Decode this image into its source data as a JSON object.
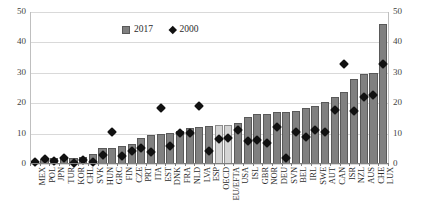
{
  "chart_data": {
    "type": "bar",
    "title": "",
    "subtitle": "",
    "xlabel": "",
    "ylabel": "",
    "ylim": [
      0,
      50
    ],
    "yticks": [
      0,
      10,
      20,
      30,
      40,
      50
    ],
    "grid": true,
    "dual_axis": true,
    "right_yticks": [
      0,
      10,
      20,
      30,
      40,
      50
    ],
    "legend_position": "top-center",
    "legend": [
      {
        "name": "2017",
        "marker": "square",
        "color": "#808080"
      },
      {
        "name": "2000",
        "marker": "diamond",
        "color": "#111111"
      }
    ],
    "categories": [
      "MEX",
      "POL",
      "JPN",
      "TUR",
      "KOR",
      "CHL",
      "SVK",
      "HUN",
      "GRC",
      "FIN",
      "CZE",
      "PRT",
      "ITA",
      "EST",
      "DNK",
      "FRA",
      "NLD",
      "LVA",
      "ESP",
      "OECD",
      "EU/EFTA",
      "USA",
      "ISL",
      "GBR",
      "NOR",
      "DEU",
      "SVN",
      "BEL",
      "IRL",
      "SWE",
      "AUT",
      "CAN",
      "ISR",
      "NZL",
      "AUS",
      "CHE",
      "LUX"
    ],
    "highlight_categories": [
      "OECD",
      "EU/EFTA"
    ],
    "series": [
      {
        "name": "2017",
        "marker": "bar",
        "values": [
          0.9,
          1.7,
          1.9,
          2.0,
          2.1,
          2.3,
          3.3,
          5.2,
          5.3,
          6.0,
          6.6,
          8.6,
          9.5,
          10.0,
          10.2,
          11.0,
          11.8,
          12.1,
          12.6,
          12.9,
          12.9,
          13.5,
          15.5,
          16.5,
          16.6,
          17.0,
          17.0,
          17.6,
          18.4,
          19.1,
          20.3,
          21.9,
          23.6,
          28.0,
          29.7,
          29.9,
          46.0
        ]
      },
      {
        "name": "2000",
        "marker": "diamond",
        "values": [
          0.5,
          1.6,
          1.0,
          1.9,
          0.3,
          1.3,
          0.5,
          2.9,
          10.4,
          2.6,
          4.3,
          5.2,
          3.9,
          18.3,
          5.8,
          10.1,
          10.1,
          19.0,
          4.2,
          8.1,
          8.6,
          11.1,
          7.6,
          7.9,
          6.8,
          12.1,
          1.9,
          10.5,
          8.8,
          11.3,
          10.4,
          17.8,
          32.9,
          17.5,
          22.0,
          22.6,
          33.0
        ]
      }
    ]
  }
}
